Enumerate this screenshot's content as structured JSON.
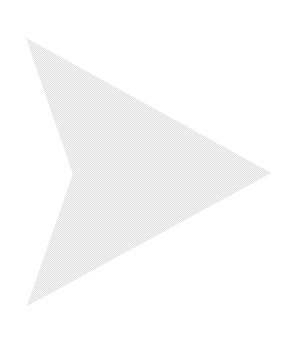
{
  "canvas": {
    "width": 296,
    "height": 338,
    "background_color": "#ffffff"
  },
  "shape": {
    "name": "right-pointing-arrowhead",
    "kind": "polygon",
    "point_count": 4,
    "fill_color": "#e4e4e4",
    "fill_color_light": "#f5f5f5",
    "fill_texture": "fine-dither-halftone",
    "stroke": "none",
    "points": "26,38 271,173 27,306 73,174",
    "vertices": [
      {
        "label": "top-left-tip",
        "x": 26,
        "y": 38
      },
      {
        "label": "right-tip",
        "x": 271,
        "y": 173
      },
      {
        "label": "bottom-left-tip",
        "x": 27,
        "y": 306
      },
      {
        "label": "notch-apex",
        "x": 73,
        "y": 174
      }
    ],
    "bounding_box": {
      "x": 26,
      "y": 38,
      "width": 245,
      "height": 268
    }
  }
}
